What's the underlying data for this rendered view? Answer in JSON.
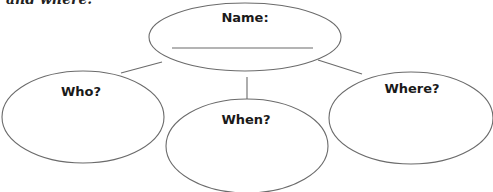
{
  "intro_text_fragment": "and where.",
  "diagram": {
    "center": {
      "label": "Name:",
      "has_write_line": true
    },
    "nodes": [
      {
        "id": "who",
        "label": "Who?"
      },
      {
        "id": "when",
        "label": "When?"
      },
      {
        "id": "where",
        "label": "Where?"
      }
    ]
  },
  "colors": {
    "stroke": "#6b6b6b",
    "text": "#1a1a1a",
    "background": "#ffffff"
  }
}
